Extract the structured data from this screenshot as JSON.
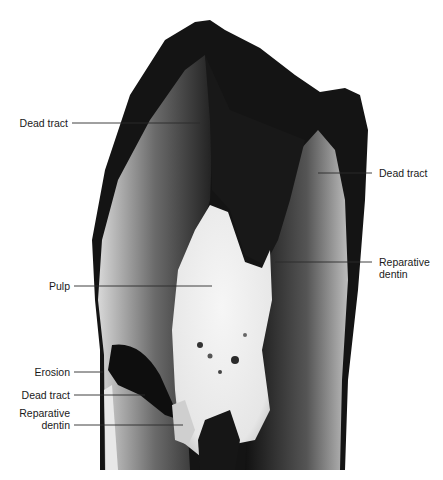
{
  "figure": {
    "labels_left": [
      {
        "id": "dead-tract-top",
        "text": "Dead tract"
      },
      {
        "id": "pulp",
        "text": "Pulp"
      },
      {
        "id": "erosion",
        "text": "Erosion"
      },
      {
        "id": "dead-tract-bottom",
        "text": "Dead tract"
      },
      {
        "id": "reparative-dentin-bottom-1",
        "text": "Reparative"
      },
      {
        "id": "reparative-dentin-bottom-2",
        "text": "dentin"
      }
    ],
    "labels_right": [
      {
        "id": "dead-tract-right",
        "text": "Dead tract"
      },
      {
        "id": "reparative-dentin-right-1",
        "text": "Reparative"
      },
      {
        "id": "reparative-dentin-right-2",
        "text": "dentin"
      }
    ]
  }
}
